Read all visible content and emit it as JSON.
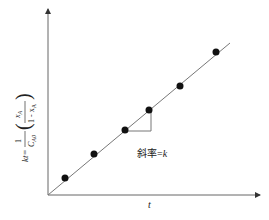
{
  "chart_data": {
    "type": "scatter",
    "title": "",
    "xlabel": "t",
    "ylabel": "kt = (1/C_A0)(x_A/(1 - x_A))",
    "ylabel_parts": {
      "lhs": "kt=",
      "num": "1",
      "den_main": "C",
      "den_sub": "A0",
      "frac_num_main": "x",
      "frac_num_sub": "A",
      "frac_den_main": "1 - x",
      "frac_den_sub": "A"
    },
    "annotation": "斜率=k",
    "annotation_parts": {
      "cjk": "斜率=",
      "var": "k"
    },
    "grid": false,
    "points": [
      {
        "x": 1,
        "y": 1
      },
      {
        "x": 2,
        "y": 2
      },
      {
        "x": 3,
        "y": 3
      },
      {
        "x": 4,
        "y": 4
      },
      {
        "x": 5,
        "y": 5
      },
      {
        "x": 6,
        "y": 6
      }
    ],
    "fit_line": {
      "slope_label": "k",
      "through_origin": true
    },
    "pixel_points": [
      [
        65,
        178
      ],
      [
        94,
        154
      ],
      [
        125,
        130
      ],
      [
        149,
        110
      ],
      [
        180,
        86
      ],
      [
        216,
        52
      ]
    ],
    "line_pixels": {
      "x1": 48,
      "y1": 195,
      "x2": 230,
      "y2": 43
    },
    "slope_triangle": {
      "x1": 125,
      "y1": 131,
      "x2": 151,
      "y2": 131,
      "x3": 151,
      "y3": 110
    },
    "axes": {
      "origin": [
        48,
        195
      ],
      "y_top": 8,
      "x_right": 261
    },
    "colors": {
      "axis": "#555555",
      "line": "#777777",
      "point": "#111111"
    }
  }
}
